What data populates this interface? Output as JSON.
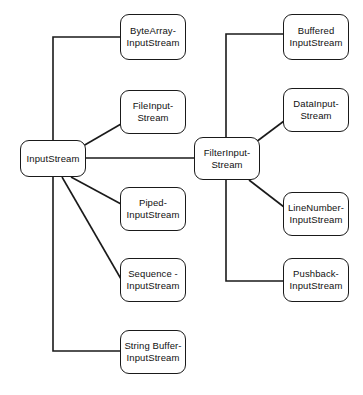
{
  "diagram": {
    "type": "class-hierarchy",
    "canvas": {
      "width": 363,
      "height": 395
    },
    "style": {
      "background": "#ffffff",
      "node_fill": "#ffffff",
      "node_stroke": "#1a1a1a",
      "edge_stroke": "#1a1a1a",
      "text_color": "#111111"
    },
    "nodes": [
      {
        "id": "input_stream",
        "label": "InputStream",
        "x": 20,
        "y": 140,
        "w": 66,
        "h": 37,
        "role": "root"
      },
      {
        "id": "byte_array_input_stream",
        "label": "ByteArray-\nInputStream",
        "x": 120,
        "y": 14,
        "w": 66,
        "h": 46,
        "role": "subclass"
      },
      {
        "id": "file_input_stream",
        "label": "FileInput-\nStream",
        "x": 120,
        "y": 90,
        "w": 66,
        "h": 44,
        "role": "subclass"
      },
      {
        "id": "piped_input_stream",
        "label": "Piped-\nInputStream",
        "x": 120,
        "y": 187,
        "w": 66,
        "h": 44,
        "role": "subclass"
      },
      {
        "id": "sequence_input_stream",
        "label": "Sequence -\nInputStream",
        "x": 120,
        "y": 258,
        "w": 66,
        "h": 44,
        "role": "subclass"
      },
      {
        "id": "string_buffer_input_stream",
        "label": "String Buffer-\nInputStream",
        "x": 120,
        "y": 330,
        "w": 66,
        "h": 44,
        "role": "subclass"
      },
      {
        "id": "filter_input_stream",
        "label": "FilterInput-\nStream",
        "x": 194,
        "y": 137,
        "w": 66,
        "h": 43,
        "role": "intermediate"
      },
      {
        "id": "buffered_input_stream",
        "label": "Buffered\nInputStream",
        "x": 283,
        "y": 14,
        "w": 66,
        "h": 46,
        "role": "subclass"
      },
      {
        "id": "data_input_stream",
        "label": "DataInput-\nStream",
        "x": 283,
        "y": 88,
        "w": 66,
        "h": 44,
        "role": "subclass"
      },
      {
        "id": "line_number_input_stream",
        "label": "LineNumber-\nInputStream",
        "x": 283,
        "y": 192,
        "w": 66,
        "h": 44,
        "role": "subclass"
      },
      {
        "id": "pushback_input_stream",
        "label": "Pushback-\nInputStream",
        "x": 283,
        "y": 258,
        "w": 66,
        "h": 44,
        "role": "subclass"
      }
    ],
    "edges": [
      {
        "id": "edge-inputstream-bytearray",
        "from": "input_stream",
        "to": "byte_array_input_stream",
        "points": "53,140 53,37 120,37",
        "kind": "orthogonal"
      },
      {
        "id": "edge-inputstream-fileinput",
        "from": "input_stream",
        "to": "file_input_stream",
        "points": "83,146 121,124",
        "kind": "diagonal"
      },
      {
        "id": "edge-inputstream-piped",
        "from": "input_stream",
        "to": "piped_input_stream",
        "points": "71,177 121,204",
        "kind": "diagonal"
      },
      {
        "id": "edge-inputstream-sequence",
        "from": "input_stream",
        "to": "sequence_input_stream",
        "points": "62,177 121,279",
        "kind": "diagonal"
      },
      {
        "id": "edge-inputstream-stringbuffer",
        "from": "input_stream",
        "to": "string_buffer_input_stream",
        "points": "53,177 53,351 120,351",
        "kind": "orthogonal"
      },
      {
        "id": "edge-inputstream-filterinput",
        "from": "input_stream",
        "to": "filter_input_stream",
        "points": "86,158 194,158",
        "kind": "straight"
      },
      {
        "id": "edge-filterinput-buffered",
        "from": "filter_input_stream",
        "to": "buffered_input_stream",
        "points": "226,137 226,34 283,34",
        "kind": "orthogonal"
      },
      {
        "id": "edge-filterinput-datainput",
        "from": "filter_input_stream",
        "to": "data_input_stream",
        "points": "256,142 284,121",
        "kind": "diagonal"
      },
      {
        "id": "edge-filterinput-linenumber",
        "from": "filter_input_stream",
        "to": "line_number_input_stream",
        "points": "249,180 284,207",
        "kind": "diagonal"
      },
      {
        "id": "edge-filterinput-pushback",
        "from": "filter_input_stream",
        "to": "pushback_input_stream",
        "points": "226,180 226,281 283,281",
        "kind": "orthogonal"
      }
    ]
  }
}
